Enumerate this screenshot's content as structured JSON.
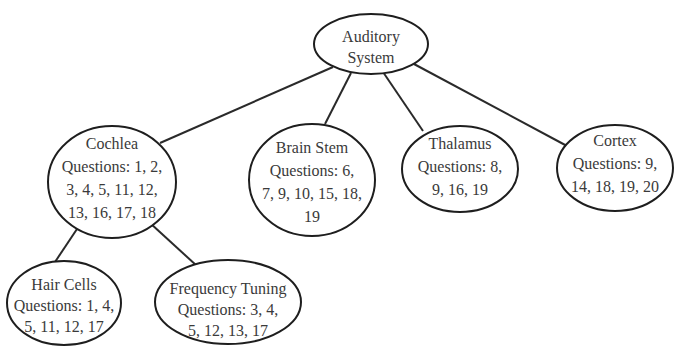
{
  "diagram": {
    "title_partial": "",
    "nodes": {
      "root": {
        "label": "Auditory System",
        "lines": [
          "Auditory",
          "System"
        ]
      },
      "cochlea": {
        "label": "Cochlea",
        "lines": [
          "Cochlea",
          "Questions: 1, 2,",
          "3, 4, 5, 11, 12,",
          "13, 16, 17, 18"
        ]
      },
      "brain_stem": {
        "label": "Brain Stem",
        "lines": [
          "Brain Stem",
          "Questions: 6,",
          "7, 9, 10, 15, 18,",
          "19"
        ]
      },
      "thalamus": {
        "label": "Thalamus",
        "lines": [
          "Thalamus",
          "Questions: 8,",
          "9, 16, 19"
        ]
      },
      "cortex": {
        "label": "Cortex",
        "lines": [
          "Cortex",
          "Questions: 9,",
          "14, 18, 19, 20"
        ]
      },
      "hair_cells": {
        "label": "Hair Cells",
        "lines": [
          "Hair Cells",
          "Questions: 1, 4,",
          "5, 11, 12, 17"
        ]
      },
      "frequency_tuning": {
        "label": "Frequency Tuning",
        "lines": [
          "Frequency Tuning",
          "Questions: 3, 4,",
          "5, 12, 13, 17"
        ]
      }
    },
    "edges": [
      {
        "from": "Auditory System",
        "to": "Cochlea"
      },
      {
        "from": "Auditory System",
        "to": "Brain Stem"
      },
      {
        "from": "Auditory System",
        "to": "Thalamus"
      },
      {
        "from": "Auditory System",
        "to": "Cortex"
      },
      {
        "from": "Cochlea",
        "to": "Hair Cells"
      },
      {
        "from": "Cochlea",
        "to": "Frequency Tuning"
      }
    ],
    "colors": {
      "stroke": "#1e1e1e",
      "text": "#3a3a3a",
      "background": "#ffffff"
    }
  }
}
